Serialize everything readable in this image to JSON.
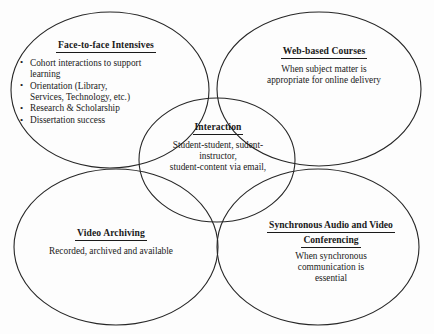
{
  "diagram": {
    "type": "venn-cluster",
    "background_color": "#fdfdfd",
    "line_color": "#262626",
    "text_color": "#1a1a1a",
    "nodes": {
      "face_to_face": {
        "title": "Face-to-face Intensives",
        "bullets": [
          {
            "line1": "Cohort interactions to support",
            "line2": "learning"
          },
          {
            "line1": "Orientation (Library,",
            "line2": "Services, Technology, etc.)"
          },
          {
            "line1": "Research & Scholarship",
            "line2": ""
          },
          {
            "line1": "Dissertation success",
            "line2": ""
          }
        ]
      },
      "web_based": {
        "title": "Web-based Courses",
        "body_lines": [
          "When subject matter is",
          "appropriate for online delivery"
        ]
      },
      "interaction": {
        "title": "Interaction",
        "body_lines": [
          "Student-student, sudent-",
          "instructor,",
          "student-content via email,"
        ]
      },
      "video_archiving": {
        "title": "Video Archiving",
        "body_lines": [
          "Recorded, archived and available"
        ]
      },
      "synchronous": {
        "title_lines": [
          "Synchronous Audio and Video",
          "Conferencing "
        ],
        "body_lines": [
          "When synchronous",
          "communication is",
          "essential"
        ]
      }
    }
  }
}
